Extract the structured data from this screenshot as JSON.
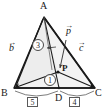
{
  "figure": {
    "background_color": "#ffffff",
    "stroke_color": "#1a1a1a",
    "fill_color": "#f2f2f2"
  },
  "vertices": {
    "A": {
      "label": "A",
      "x": 44,
      "y": 17
    },
    "B": {
      "label": "B",
      "x": 14,
      "y": 88
    },
    "C": {
      "label": "C",
      "x": 95,
      "y": 88
    },
    "D": {
      "label": "D",
      "x": 59,
      "y": 88
    },
    "P": {
      "label": "P",
      "x": 58,
      "y": 72
    }
  },
  "vectors": [
    {
      "name": "vector-b",
      "label": "b",
      "arrow": "→",
      "x": 12,
      "y": 47
    },
    {
      "name": "vector-c",
      "label": "c",
      "arrow": "→",
      "x": 78,
      "y": 47
    },
    {
      "name": "vector-p",
      "label": "p",
      "arrow": "→",
      "x": 64,
      "y": 30
    }
  ],
  "area_ratios": [
    {
      "name": "ratio-upper",
      "value": "3",
      "x": 34,
      "y": 42
    },
    {
      "name": "ratio-lower",
      "value": "1",
      "x": 45,
      "y": 78
    }
  ],
  "segment_ratios": [
    {
      "name": "segment-bd",
      "value": "5",
      "x": 29,
      "y": 97
    },
    {
      "name": "segment-dc",
      "value": "4",
      "x": 69,
      "y": 97
    }
  ]
}
